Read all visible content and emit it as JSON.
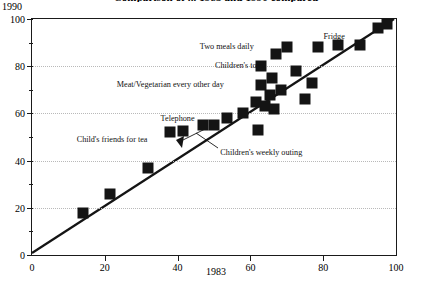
{
  "chart_data": {
    "type": "scatter",
    "title": "Comparison of ... 1983 and 1990 compared",
    "xlabel": "1983",
    "ylabel": "1990",
    "xlim": [
      0,
      100
    ],
    "ylim": [
      0,
      100
    ],
    "grid": "horizontal-dotted",
    "legend": "none",
    "reference_line": {
      "label": "y = x",
      "from": [
        0,
        0
      ],
      "to": [
        100,
        100
      ]
    },
    "xticks": [
      0,
      20,
      40,
      60,
      80,
      100
    ],
    "yticks": [
      0,
      20,
      40,
      60,
      80,
      100
    ],
    "y_minor_ticks": [
      10,
      30,
      50,
      70,
      90
    ],
    "points": [
      {
        "x": 14,
        "y": 18
      },
      {
        "x": 21.5,
        "y": 26
      },
      {
        "x": 32,
        "y": 37
      },
      {
        "x": 38,
        "y": 52
      },
      {
        "x": 41.5,
        "y": 52.5
      },
      {
        "x": 47,
        "y": 55
      },
      {
        "x": 50,
        "y": 55
      },
      {
        "x": 53.5,
        "y": 58
      },
      {
        "x": 58,
        "y": 60
      },
      {
        "x": 61.5,
        "y": 65
      },
      {
        "x": 62,
        "y": 53
      },
      {
        "x": 63,
        "y": 72
      },
      {
        "x": 63,
        "y": 80
      },
      {
        "x": 64,
        "y": 63
      },
      {
        "x": 65.5,
        "y": 68
      },
      {
        "x": 66,
        "y": 75
      },
      {
        "x": 66.5,
        "y": 62
      },
      {
        "x": 67,
        "y": 85
      },
      {
        "x": 68.5,
        "y": 70
      },
      {
        "x": 70,
        "y": 88
      },
      {
        "x": 72.5,
        "y": 78
      },
      {
        "x": 75,
        "y": 66
      },
      {
        "x": 77,
        "y": 73
      },
      {
        "x": 78.5,
        "y": 88
      },
      {
        "x": 84,
        "y": 89
      },
      {
        "x": 90,
        "y": 89
      },
      {
        "x": 95,
        "y": 96
      },
      {
        "x": 97.5,
        "y": 98
      }
    ],
    "annotations": [
      {
        "text": "Two meals daily",
        "x": 53.5,
        "y": 88.5
      },
      {
        "text": "Fridge",
        "x": 83,
        "y": 93
      },
      {
        "text": "Children's toys",
        "x": 57,
        "y": 80.5
      },
      {
        "text": "Meat/Vegetarian every other day",
        "x": 38,
        "y": 72.5
      },
      {
        "text": "Telephone",
        "x": 40,
        "y": 58
      },
      {
        "text": "Child's friends for tea",
        "x": 22,
        "y": 49
      },
      {
        "text": "Children's weekly outing",
        "x": 63,
        "y": 43.5
      }
    ]
  }
}
